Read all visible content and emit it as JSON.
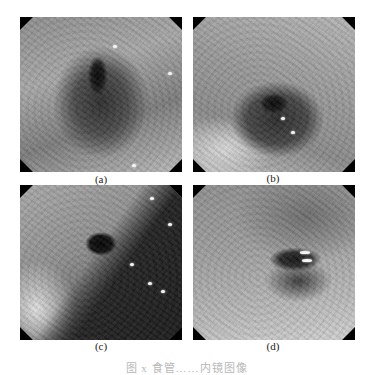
{
  "figure": {
    "panels": [
      {
        "id": "a",
        "label": "(a)",
        "content": "grayscale endoscopic image, dark central lumen with radiating mucosal folds"
      },
      {
        "id": "b",
        "label": "(b)",
        "content": "grayscale endoscopic image, dark lumen below center with irregular darker patch"
      },
      {
        "id": "c",
        "label": "(c)",
        "content": "grayscale endoscopic image, lumen upper-center with curved mucosal boundary line"
      },
      {
        "id": "d",
        "label": "(d)",
        "content": "grayscale endoscopic image, ring-like folds with bright specular reflection right of center"
      }
    ],
    "caption": "图 x  食管……内镜图像"
  },
  "colors": {
    "background": "#ffffff",
    "label_text": "#222222",
    "caption_text": "#b8b8b8",
    "corner_mask": "#000000"
  }
}
